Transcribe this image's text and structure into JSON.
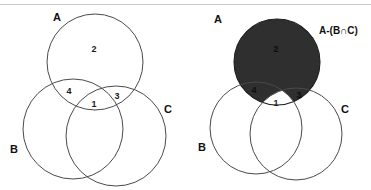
{
  "figure": {
    "background_color": "#ffffff",
    "outline_color": "#4a4a4a",
    "shade_color": "#2f2f2f",
    "text_color": "#111111",
    "top_rule_color": "#c8cacc"
  },
  "left_diagram": {
    "name": "unshaded-venn",
    "set_labels": {
      "a": "A",
      "b": "B",
      "c": "C"
    },
    "region_numbers": {
      "a_only": "2",
      "a_and_b_only": "4",
      "a_and_c_only": "3",
      "a_and_b_and_c": "1"
    },
    "circles": [
      {
        "id": "A",
        "cx": 95,
        "cy": 62,
        "r": 48
      },
      {
        "id": "B",
        "cx": 73,
        "cy": 129,
        "r": 50
      },
      {
        "id": "C",
        "cx": 116,
        "cy": 136,
        "r": 50
      }
    ]
  },
  "right_diagram": {
    "name": "shaded-venn",
    "set_labels": {
      "a": "A",
      "b": "B",
      "c": "C"
    },
    "expression_label": "A-(B∩C)",
    "region_numbers": {
      "a_only": "2",
      "a_and_b_only": "4",
      "a_and_c_only": "3",
      "a_and_b_and_c": "1"
    },
    "shaded_region": "A minus the intersection of B and C",
    "unshaded_region": "1",
    "circles": [
      {
        "id": "A",
        "cx": 277,
        "cy": 62,
        "r": 43
      },
      {
        "id": "B",
        "cx": 256,
        "cy": 128,
        "r": 46
      },
      {
        "id": "C",
        "cx": 296,
        "cy": 134,
        "r": 46
      }
    ]
  }
}
